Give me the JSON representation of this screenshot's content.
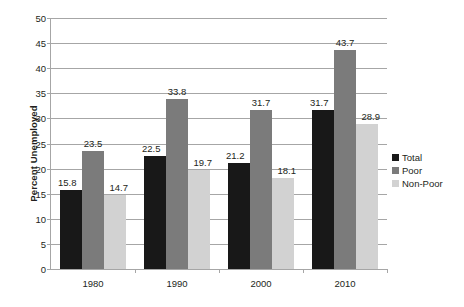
{
  "chart_data": {
    "type": "bar",
    "title": "",
    "subtitle": "",
    "xlabel": "",
    "ylabel": "Percent Unemployed",
    "categories": [
      "1980",
      "1990",
      "2000",
      "2010"
    ],
    "series": [
      {
        "name": "Total",
        "color": "#181818",
        "values": [
          15.8,
          22.5,
          21.2,
          31.7
        ]
      },
      {
        "name": "Poor",
        "color": "#7b7b7b",
        "values": [
          23.5,
          33.8,
          31.7,
          43.7
        ]
      },
      {
        "name": "Non-Poor",
        "color": "#d2d2d2",
        "values": [
          14.7,
          19.7,
          18.1,
          28.9
        ]
      }
    ],
    "ylim": [
      0,
      50
    ],
    "ytick_step": 5,
    "yticks": [
      "0",
      "5",
      "10",
      "15",
      "20",
      "25",
      "30",
      "35",
      "40",
      "45",
      "50"
    ],
    "grid": true,
    "grid_axis": "y",
    "legend_position": "right",
    "data_labels": true,
    "axis_color": "#a6a6a6",
    "text_color": "#231f20",
    "background": "#ffffff"
  }
}
